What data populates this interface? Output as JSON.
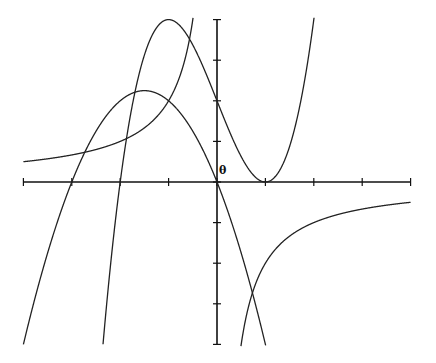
{
  "chart_data": {
    "type": "line",
    "title": "",
    "xlabel": "",
    "ylabel": "",
    "origin_label": "θ",
    "xlim": [
      -4,
      4
    ],
    "ylim": [
      -4,
      4
    ],
    "x_ticks": [
      -4,
      -3,
      -2,
      -1,
      0,
      1,
      2,
      3,
      4
    ],
    "y_ticks": [
      -4,
      -3,
      -2,
      -1,
      0,
      1,
      2,
      3,
      4
    ],
    "grid": false,
    "legend": null,
    "series": [
      {
        "name": "cubic",
        "expression": "x^3 - 3x + 2",
        "x": [
          -2.4,
          -2,
          -1.5,
          -1,
          -0.5,
          0,
          0.5,
          1,
          1.5,
          2
        ],
        "values": [
          -4.62,
          0,
          3.125,
          4,
          3.375,
          2,
          0.625,
          0,
          0.875,
          4
        ]
      },
      {
        "name": "parabola",
        "expression": "-x^2 - 3x",
        "x": [
          -4,
          -3,
          -2,
          -1.5,
          -1,
          0,
          1
        ],
        "values": [
          -4,
          0,
          2,
          2.25,
          2,
          0,
          -4
        ]
      },
      {
        "name": "hyperbola",
        "expression": "-2/x",
        "x": [
          -4,
          -3,
          -2,
          -1,
          -0.5,
          0.5,
          1,
          2,
          3,
          4
        ],
        "values": [
          0.5,
          0.667,
          1,
          2,
          4,
          -4,
          -2,
          -1,
          -0.667,
          -0.5
        ]
      }
    ]
  },
  "colors": {
    "curve": "#222222",
    "axis": "#111111",
    "background": "#ffffff"
  }
}
